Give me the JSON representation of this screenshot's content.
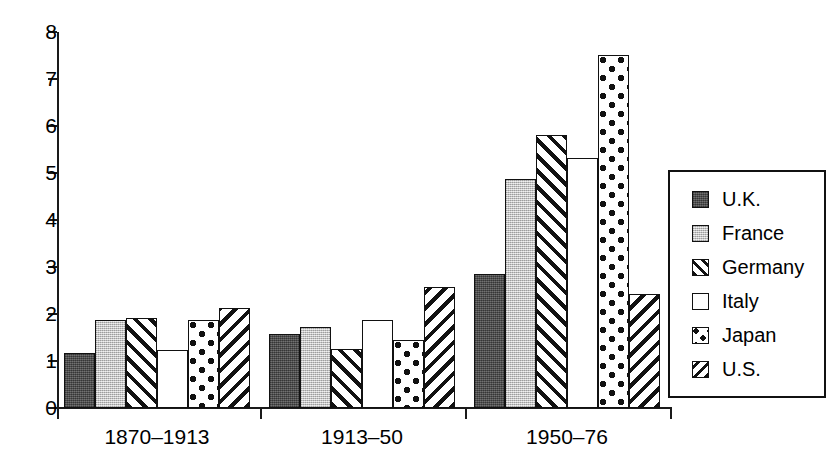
{
  "chart_data": {
    "type": "bar",
    "title": "",
    "subtitle": "",
    "xlabel": "",
    "ylabel": "",
    "categories": [
      "1870–1913",
      "1913–50",
      "1950–76"
    ],
    "series": [
      {
        "name": "U.K.",
        "values": [
          1.18,
          1.58,
          2.85
        ],
        "pattern": "solid-dark-gray",
        "color": "#545454"
      },
      {
        "name": "France",
        "values": [
          1.87,
          1.73,
          4.88
        ],
        "pattern": "solid-light-gray",
        "color": "#cccccc"
      },
      {
        "name": "Germany",
        "values": [
          1.92,
          1.25,
          5.8
        ],
        "pattern": "diagonal-forward",
        "color": "#ffffff"
      },
      {
        "name": "Italy",
        "values": [
          1.23,
          1.88,
          5.33
        ],
        "pattern": "empty-white",
        "color": "#ffffff"
      },
      {
        "name": "Japan",
        "values": [
          1.87,
          1.45,
          7.52
        ],
        "pattern": "polka-dots",
        "color": "#ffffff"
      },
      {
        "name": "U.S.",
        "values": [
          2.13,
          2.58,
          2.42
        ],
        "pattern": "diagonal-back",
        "color": "#ffffff"
      }
    ],
    "ylim": [
      0,
      8
    ],
    "yticks": [
      0,
      1,
      2,
      3,
      4,
      5,
      6,
      7,
      8
    ],
    "ytick_labels": [
      "0",
      "1",
      "2",
      "3",
      "4",
      "5",
      "6",
      "7",
      "8"
    ],
    "grid": false,
    "legend_position": "right-outside",
    "axis_color": "#1a1a1a",
    "bar_border_color": "#111111",
    "background": "#ffffff"
  },
  "legend": {
    "items": [
      {
        "label": "U.K."
      },
      {
        "label": "France"
      },
      {
        "label": "Germany"
      },
      {
        "label": "Italy"
      },
      {
        "label": "Japan"
      },
      {
        "label": "U.S."
      }
    ]
  }
}
